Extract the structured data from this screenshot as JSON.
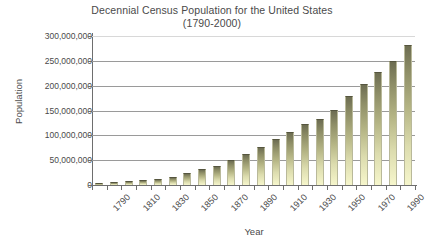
{
  "chart_data": {
    "type": "bar",
    "title": "Decennial Census Population for the United States",
    "subtitle": "(1790-2000)",
    "xlabel": "Year",
    "ylabel": "Population",
    "ylim": [
      0,
      300000000
    ],
    "ytick_values": [
      0,
      50000000,
      100000000,
      150000000,
      200000000,
      250000000,
      300000000
    ],
    "ytick_labels": [
      "0",
      "50,000,000",
      "100,000,000",
      "150,000,000",
      "200,000,000",
      "250,000,000",
      "300,000,000"
    ],
    "grid": "horizontal",
    "legend": "none",
    "bar_color_top": "#6d6d52",
    "bar_color_bottom": "#f6f6cc",
    "categories": [
      "1790",
      "1800",
      "1810",
      "1820",
      "1830",
      "1840",
      "1850",
      "1860",
      "1870",
      "1880",
      "1890",
      "1900",
      "1910",
      "1920",
      "1930",
      "1940",
      "1950",
      "1960",
      "1970",
      "1980",
      "1990",
      "2000"
    ],
    "xtick_labels_shown": [
      "1790",
      "1810",
      "1830",
      "1850",
      "1870",
      "1890",
      "1910",
      "1930",
      "1950",
      "1970",
      "1990"
    ],
    "values": [
      3929214,
      5308483,
      7239881,
      9638453,
      12866020,
      17069453,
      23191876,
      31443321,
      38558371,
      50189209,
      62979766,
      76212168,
      92228496,
      106021537,
      123202624,
      132164569,
      151325798,
      179323175,
      203211926,
      226545805,
      248709873,
      281421906
    ]
  }
}
